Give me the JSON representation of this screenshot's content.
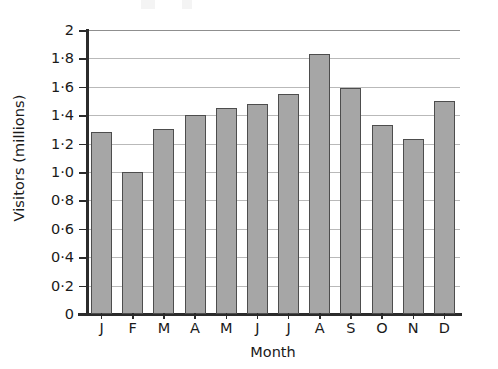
{
  "chart_data": {
    "type": "bar",
    "title": "",
    "xlabel": "Month",
    "ylabel": "Visitors (millions)",
    "categories": [
      "J",
      "F",
      "M",
      "A",
      "M",
      "J",
      "J",
      "A",
      "S",
      "O",
      "N",
      "D"
    ],
    "category_names": [
      "January",
      "February",
      "March",
      "April",
      "May",
      "June",
      "July",
      "August",
      "September",
      "October",
      "November",
      "December"
    ],
    "values": [
      1.28,
      1.0,
      1.3,
      1.4,
      1.45,
      1.48,
      1.55,
      1.83,
      1.59,
      1.33,
      1.23,
      1.5
    ],
    "ylim": [
      0,
      2
    ],
    "ytick_values": [
      0,
      0.2,
      0.4,
      0.6,
      0.8,
      1.0,
      1.2,
      1.4,
      1.6,
      1.8,
      2
    ],
    "ytick_labels": [
      "0",
      "0·0·2",
      "0·4",
      "0·6",
      "0·8",
      "1·0",
      "1·2",
      "1·4",
      "1·6",
      "1·8",
      "2"
    ],
    "ytick_labels_display": [
      "0",
      "0·2",
      "0·4",
      "0·6",
      "0·8",
      "1·0",
      "1·2",
      "1·4",
      "1·6",
      "1·8",
      "2"
    ],
    "grid": true,
    "grid_axis": "y",
    "legend": false,
    "bar_fill_color": "#a6a6a6",
    "bar_edge_color": "#4d4d4d",
    "gridline_color": "#b9b9b9",
    "axis_color": "#2b2b2b"
  }
}
